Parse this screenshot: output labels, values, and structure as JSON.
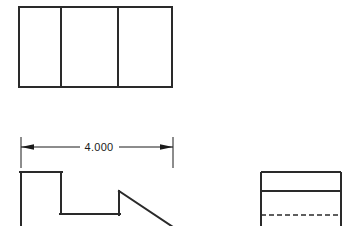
{
  "drawing": {
    "title": "Orthographic Multiview Drawing",
    "canvas": {
      "width": 356,
      "height": 226
    },
    "background_color": "#ffffff",
    "line_color": "#2a2a2a",
    "dim_color": "#1a1a1a",
    "object_line_width": 2.0,
    "dim_line_width": 1.0,
    "hidden_line_width": 1.2,
    "hidden_dash_pattern": "5,3"
  },
  "top_view": {
    "name": "top-view",
    "outline": {
      "x": 19,
      "y": 7,
      "width": 153,
      "height": 80
    },
    "divider_lines": [
      {
        "label": "divider-1",
        "x": 61,
        "y1": 7,
        "y2": 87
      },
      {
        "label": "divider-2",
        "x": 118,
        "y1": 7,
        "y2": 87
      }
    ],
    "panel_count": 3
  },
  "dimension": {
    "name": "width-dimension",
    "value_text": "4.000",
    "nominal_value": 4.0,
    "units": "inches",
    "dim_line_y": 147,
    "extension_lines": [
      {
        "label": "ext-left",
        "x": 21,
        "y1": 137,
        "y2": 168
      },
      {
        "label": "ext-right",
        "x": 173,
        "y1": 137,
        "y2": 168
      }
    ],
    "segments": [
      {
        "label": "dim-seg-left",
        "x1": 21,
        "x2": 79,
        "y": 147
      },
      {
        "label": "dim-seg-right",
        "x1": 119,
        "x2": 173,
        "y": 147
      }
    ],
    "arrows": [
      {
        "label": "arrow-left",
        "tip_x": 21,
        "tail_x": 35,
        "y": 147,
        "direction": "left"
      },
      {
        "label": "arrow-right",
        "tip_x": 173,
        "tail_x": 159,
        "y": 147,
        "direction": "right"
      }
    ],
    "text_position": {
      "x": 99,
      "y": 151
    }
  },
  "front_view": {
    "name": "front-view",
    "profile_points": "21,172 21,226 21,172 61,172 61,214 119,214 119,191 172,226",
    "segments": [
      {
        "label": "left-vertical",
        "x1": 21,
        "y1": 172,
        "x2": 21,
        "y2": 226
      },
      {
        "label": "top-horizontal",
        "x1": 21,
        "y1": 172,
        "x2": 61,
        "y2": 172
      },
      {
        "label": "step-down-vertical",
        "x1": 61,
        "y1": 172,
        "x2": 61,
        "y2": 214
      },
      {
        "label": "bottom-horizontal",
        "x1": 61,
        "y1": 214,
        "x2": 119,
        "y2": 214
      },
      {
        "label": "step-up-vertical",
        "x1": 119,
        "y1": 214,
        "x2": 119,
        "y2": 191
      },
      {
        "label": "chamfer-diagonal",
        "x1": 119,
        "y1": 191,
        "x2": 175,
        "y2": 228
      }
    ]
  },
  "side_view": {
    "name": "right-side-view",
    "outline": {
      "x": 261,
      "y": 172,
      "width": 80,
      "height": 56
    },
    "solid_divider": {
      "label": "solid-divider",
      "x1": 261,
      "y1": 191,
      "x2": 341,
      "y2": 191
    },
    "hidden_line": {
      "label": "hidden-edge",
      "x1": 261,
      "y1": 215,
      "x2": 341,
      "y2": 215,
      "style": "dashed"
    }
  }
}
